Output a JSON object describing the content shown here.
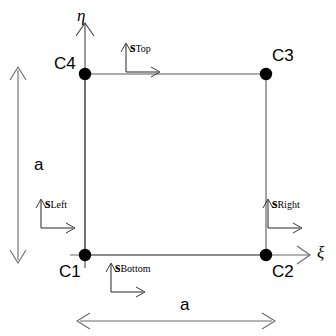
{
  "figure": {
    "type": "diagram",
    "background_color": "#ffffff",
    "line_color": "#000000",
    "edge_color": "#555555",
    "node_color": "#000000"
  },
  "axes": {
    "vertical": {
      "symbol": "η",
      "name": "eta-axis-label"
    },
    "horizontal": {
      "symbol": "ξ",
      "name": "xi-axis-label"
    }
  },
  "nodes": [
    {
      "id": "C1",
      "label": "C1",
      "position": "bottom-left"
    },
    {
      "id": "C2",
      "label": "C2",
      "position": "bottom-right"
    },
    {
      "id": "C3",
      "label": "C3",
      "position": "top-right"
    },
    {
      "id": "C4",
      "label": "C4",
      "position": "top-left"
    }
  ],
  "edge_frames": [
    {
      "id": "top",
      "symbol": "s",
      "subscript": "Top"
    },
    {
      "id": "right",
      "symbol": "s",
      "subscript": "Right"
    },
    {
      "id": "left",
      "symbol": "s",
      "subscript": "Left"
    },
    {
      "id": "bottom",
      "symbol": "s",
      "subscript": "Bottom"
    }
  ],
  "dimensions": [
    {
      "id": "height",
      "label": "a",
      "orientation": "vertical"
    },
    {
      "id": "width",
      "label": "a",
      "orientation": "horizontal"
    }
  ]
}
